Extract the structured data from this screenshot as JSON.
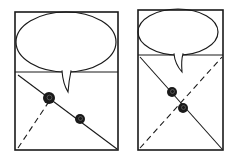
{
  "diagram": {
    "type": "storyboard-sketch",
    "ink_color": "#1a1a1a",
    "background": "#ffffff",
    "panels": [
      {
        "id": "panel-1",
        "frame": {
          "x": 15,
          "y": 12,
          "w": 103,
          "h": 138
        },
        "balloon_divider_y": 72,
        "balloon": {
          "cx": 66,
          "cy": 42,
          "rx": 50,
          "ry": 30,
          "tail_tip": [
            68,
            92
          ]
        },
        "solid_diagonal": {
          "from": [
            18,
            75
          ],
          "to": [
            117,
            149
          ]
        },
        "dashed_line": {
          "from": [
            18,
            148
          ],
          "to": [
            50,
            100
          ]
        },
        "characters": [
          {
            "label": "character-a",
            "cx": 49,
            "cy": 98,
            "r": 6
          },
          {
            "label": "character-b",
            "cx": 80,
            "cy": 119,
            "r": 5
          }
        ]
      },
      {
        "id": "panel-2",
        "frame": {
          "x": 138,
          "y": 10,
          "w": 85,
          "h": 140
        },
        "balloon_divider_y": 55,
        "balloon": {
          "cx": 178,
          "cy": 32,
          "rx": 40,
          "ry": 23,
          "tail_tip": [
            182,
            72
          ]
        },
        "solid_diagonal": {
          "from": [
            140,
            57
          ],
          "to": [
            222,
            149
          ]
        },
        "dashed_line": {
          "from": [
            140,
            148
          ],
          "to": [
            222,
            57
          ]
        },
        "characters": [
          {
            "label": "character-a",
            "cx": 172,
            "cy": 92,
            "r": 5
          },
          {
            "label": "character-b",
            "cx": 183,
            "cy": 108,
            "r": 5
          }
        ]
      }
    ]
  }
}
